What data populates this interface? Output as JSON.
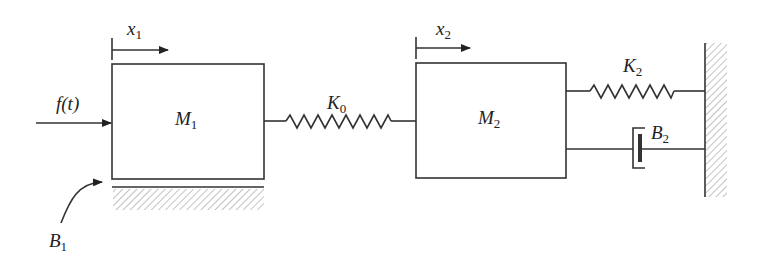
{
  "diagram": {
    "type": "mass-spring-damper system",
    "colors": {
      "line": "#333333",
      "background": "#ffffff"
    },
    "labels": {
      "x1": {
        "base": "x",
        "sub": "1"
      },
      "x2": {
        "base": "x",
        "sub": "2"
      },
      "force": "f(t)",
      "M1": {
        "base": "M",
        "sub": "1"
      },
      "M2": {
        "base": "M",
        "sub": "2"
      },
      "K0": {
        "base": "K",
        "sub": "0"
      },
      "K2": {
        "base": "K",
        "sub": "2"
      },
      "B1": {
        "base": "B",
        "sub": "1"
      },
      "B2": {
        "base": "B",
        "sub": "2"
      }
    },
    "components": [
      {
        "id": "M1",
        "kind": "mass"
      },
      {
        "id": "M2",
        "kind": "mass"
      },
      {
        "id": "K0",
        "kind": "spring",
        "connects": [
          "M1",
          "M2"
        ]
      },
      {
        "id": "K2",
        "kind": "spring",
        "connects": [
          "M2",
          "wall"
        ]
      },
      {
        "id": "B2",
        "kind": "damper",
        "connects": [
          "M2",
          "wall"
        ]
      },
      {
        "id": "B1",
        "kind": "friction",
        "connects": [
          "M1",
          "ground"
        ]
      },
      {
        "id": "f(t)",
        "kind": "applied-force",
        "on": "M1"
      }
    ]
  }
}
